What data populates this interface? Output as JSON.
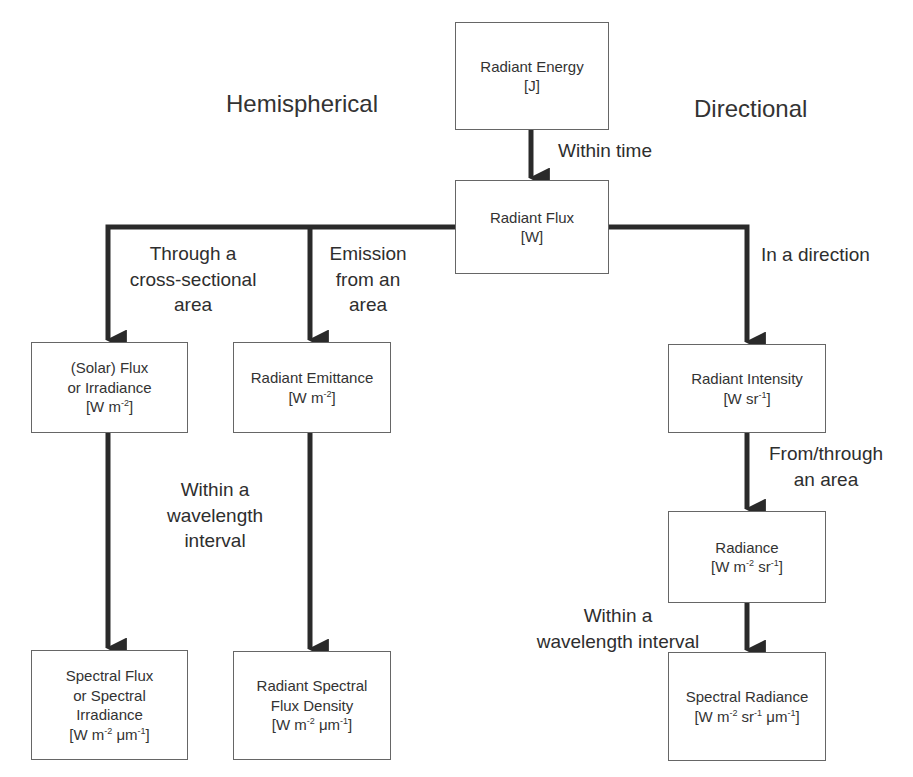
{
  "headings": {
    "left": "Hemispherical",
    "right": "Directional"
  },
  "nodes": {
    "radiant_energy": {
      "name": "Radiant Energy",
      "unit": "[J]"
    },
    "radiant_flux": {
      "name": "Radiant Flux",
      "unit": "[W]"
    },
    "solar_flux": {
      "name": "(Solar) Flux\nor Irradiance",
      "unit_pre": "[W m",
      "unit_sup": "-2",
      "unit_post": "]"
    },
    "radiant_emittance": {
      "name": "Radiant Emittance",
      "unit_pre": "[W m",
      "unit_sup": "-2",
      "unit_post": "]"
    },
    "radiant_intensity": {
      "name": "Radiant Intensity",
      "unit_pre": "[W sr",
      "unit_sup": "-1",
      "unit_post": "]"
    },
    "radiance": {
      "name": "Radiance",
      "unit_a": "[W m",
      "unit_sup1": "-2",
      "unit_b": " sr",
      "unit_sup2": "-1",
      "unit_c": "]"
    },
    "spectral_flux": {
      "name": "Spectral Flux\nor Spectral\nIrradiance",
      "unit_a": "[W m",
      "unit_sup1": "-2",
      "unit_b": " μm",
      "unit_sup2": "-1",
      "unit_c": "]"
    },
    "radiant_spectral_flux_density": {
      "name": "Radiant Spectral\nFlux Density",
      "unit_a": "[W m",
      "unit_sup1": "-2",
      "unit_b": " μm",
      "unit_sup2": "-1",
      "unit_c": "]"
    },
    "spectral_radiance": {
      "name": "Spectral Radiance",
      "unit_a": "[W m",
      "unit_sup1": "-2",
      "unit_b": " sr",
      "unit_sup2": "-1",
      "unit_c": " μm",
      "unit_sup3": "-1",
      "unit_d": "]"
    }
  },
  "edges": {
    "within_time": "Within time",
    "through_cross_section": "Through a\ncross-sectional\narea",
    "emission_from_area": "Emission\nfrom an\narea",
    "in_a_direction": "In a direction",
    "within_wavelength_left": "Within a\nwavelength\ninterval",
    "from_through_area": "From/through\nan area",
    "within_wavelength_right": "Within a\nwavelength interval"
  },
  "colors": {
    "line": "#2a2a2a",
    "box_border": "#666666",
    "text": "#333333"
  }
}
